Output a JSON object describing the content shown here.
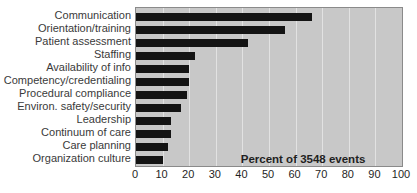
{
  "chart_data": {
    "type": "bar",
    "orientation": "horizontal",
    "title": "",
    "xlabel": "",
    "ylabel": "",
    "annotation": "Percent of 3548 events",
    "categories": [
      "Communication",
      "Orientation/training",
      "Patient assessment",
      "Staffing",
      "Availability of info",
      "Competency/credentialing",
      "Procedural compliance",
      "Environ. safety/security",
      "Leadership",
      "Continuum of care",
      "Care planning",
      "Organization culture"
    ],
    "values": [
      66,
      56,
      42,
      22,
      20,
      20,
      19,
      17,
      13,
      13,
      12,
      10
    ],
    "xlim": [
      0,
      100
    ],
    "xticks": [
      0,
      10,
      20,
      30,
      40,
      50,
      60,
      70,
      80,
      90,
      100
    ],
    "grid": "vertical-gridlines-every-10",
    "legend": "none",
    "colors": {
      "bar": "#141414",
      "plot_background": "#c8c8c8",
      "gridline": "#e2e2e2",
      "plot_border": "#8a8a8a",
      "label_text": "#3a3a3a",
      "tick_text": "#1f1f1f",
      "page_background": "#ffffff"
    }
  }
}
